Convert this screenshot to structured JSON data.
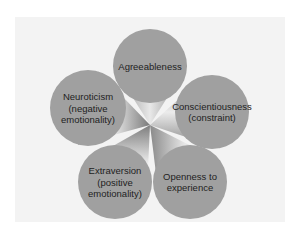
{
  "diagram": {
    "colors": {
      "background": "#ffffff",
      "panel": "#f3f3f3",
      "circle_fill": "#a0a0a0",
      "text": "#222222"
    },
    "hub": {
      "x": 150,
      "y": 125
    },
    "nodes": [
      {
        "id": "agreeableness",
        "lines": [
          "Agreeableness"
        ],
        "cx": 150,
        "cy": 66,
        "r": 37
      },
      {
        "id": "conscientiousness",
        "lines": [
          "Conscientiousness",
          "(constraint)"
        ],
        "cx": 212,
        "cy": 112,
        "r": 37
      },
      {
        "id": "openness",
        "lines": [
          "Openness to",
          "experience"
        ],
        "cx": 190,
        "cy": 182,
        "r": 37
      },
      {
        "id": "extraversion",
        "lines": [
          "Extraversion",
          "(positive",
          "emotionality)"
        ],
        "cx": 115,
        "cy": 182,
        "r": 37
      },
      {
        "id": "neuroticism",
        "lines": [
          "Neuroticism",
          "(negative",
          "emotionality)"
        ],
        "cx": 88,
        "cy": 108,
        "r": 38
      }
    ]
  }
}
